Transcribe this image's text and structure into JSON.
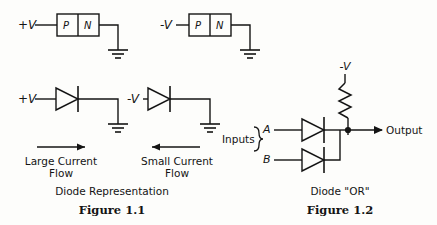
{
  "figure_1_1": {
    "caption_title": "Diode  Representation",
    "caption_number": "Figure 1.1",
    "pn_circuits": [
      {
        "supply_label": "+V",
        "region_p": "P",
        "region_n": "N"
      },
      {
        "supply_label": "-V",
        "region_p": "P",
        "region_n": "N"
      }
    ],
    "diode_circuits": [
      {
        "supply_label": "+V"
      },
      {
        "supply_label": "-V"
      }
    ],
    "current_notes": [
      {
        "line1": "Large  Current",
        "line2": "Flow",
        "arrow_direction": "right"
      },
      {
        "line1": "Small  Current",
        "line2": "Flow",
        "arrow_direction": "left"
      }
    ]
  },
  "figure_1_2": {
    "caption_title": "Diode \"OR\"",
    "caption_number": "Figure 1.2",
    "supply_label": "-V",
    "inputs_label": "Inputs",
    "input_a": "A",
    "input_b": "B",
    "output_label": "Output"
  },
  "style": {
    "ink": "#141414",
    "paper": "#fdfdfb"
  }
}
